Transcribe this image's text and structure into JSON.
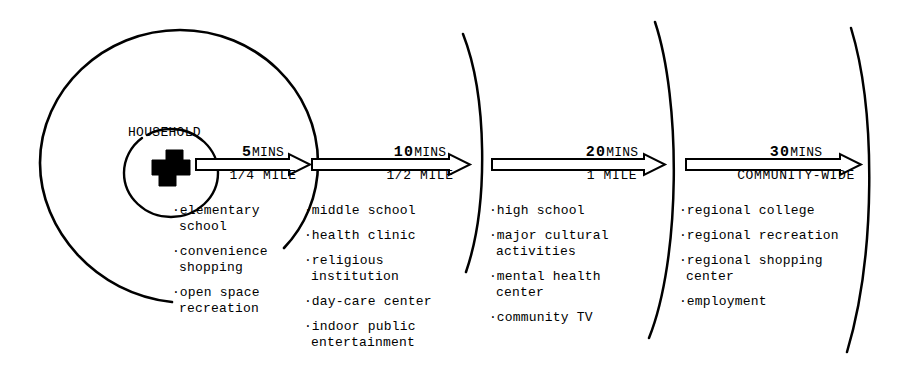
{
  "diagram": {
    "title_label": "HOUSEHOLD",
    "center_icon": "house-icon",
    "ink_color": "#000000",
    "background_color": "#ffffff"
  },
  "segments": [
    {
      "time": "5",
      "time_unit": "MINS",
      "distance": "1/4 MILE",
      "services": [
        "elementary\nschool",
        "convenience\nshopping",
        "open space\nrecreation"
      ]
    },
    {
      "time": "10",
      "time_unit": "MINS",
      "distance": "1/2 MILE",
      "services": [
        "middle school",
        "health clinic",
        "religious\ninstitution",
        "day-care center",
        "indoor public\nentertainment"
      ]
    },
    {
      "time": "20",
      "time_unit": "MINS",
      "distance": "1 MILE",
      "services": [
        "high school",
        "major cultural\nactivities",
        "mental health\ncenter",
        "community TV"
      ]
    },
    {
      "time": "30",
      "time_unit": "MINS",
      "distance": "COMMUNITY-WIDE",
      "services": [
        "regional college",
        "regional recreation",
        "regional shopping\ncenter",
        "employment"
      ]
    }
  ],
  "bullet_char": "·"
}
